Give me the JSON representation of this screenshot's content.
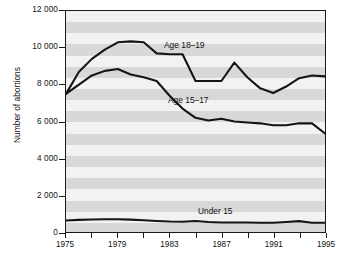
{
  "chart_data": {
    "type": "line",
    "title": "",
    "xlabel": "",
    "ylabel": "Number of abortions",
    "xlim": [
      1975,
      1995
    ],
    "ylim": [
      0,
      12000
    ],
    "grid": false,
    "legend_position": "inline-annotations",
    "background": "horizontal alternating gray bands",
    "x": [
      1975,
      1976,
      1977,
      1978,
      1979,
      1980,
      1981,
      1982,
      1983,
      1984,
      1985,
      1986,
      1987,
      1988,
      1989,
      1990,
      1991,
      1992,
      1993,
      1994,
      1995
    ],
    "y_ticks": [
      0,
      2000,
      4000,
      6000,
      8000,
      10000,
      12000
    ],
    "y_tick_labels": [
      "0",
      "2 000",
      "4 000",
      "6 000",
      "8 000",
      "10 000",
      "12 000"
    ],
    "x_ticks": [
      1975,
      1977,
      1979,
      1981,
      1983,
      1985,
      1987,
      1989,
      1991,
      1993,
      1995
    ],
    "x_tick_labels": [
      "1975",
      "",
      "1979",
      "",
      "1983",
      "",
      "1987",
      "",
      "1991",
      "",
      "1995"
    ],
    "x_labeled_ticks": [
      1975,
      1979,
      1983,
      1987,
      1991,
      1995
    ],
    "series": [
      {
        "name": "Age 18-19",
        "label": "Age 18–19",
        "color": "#151515",
        "values": [
          7500,
          8700,
          9400,
          9900,
          10300,
          10350,
          10300,
          9700,
          9650,
          9650,
          8200,
          8200,
          8200,
          9200,
          8400,
          7800,
          7550,
          7900,
          8350,
          8500,
          8450
        ]
      },
      {
        "name": "Age 15-17",
        "label": "Age 15–17",
        "color": "#151515",
        "values": [
          7500,
          8000,
          8500,
          8750,
          8850,
          8550,
          8400,
          8200,
          7400,
          6700,
          6200,
          6050,
          6150,
          6000,
          5950,
          5900,
          5800,
          5800,
          5900,
          5900,
          5350
        ]
      },
      {
        "name": "Under 15",
        "label": "Under 15",
        "color": "#151515",
        "values": [
          620,
          660,
          680,
          690,
          690,
          670,
          640,
          600,
          570,
          560,
          600,
          540,
          520,
          520,
          520,
          500,
          500,
          540,
          590,
          500,
          500
        ]
      }
    ]
  },
  "axis": {
    "y_title": "Number of abortions"
  }
}
